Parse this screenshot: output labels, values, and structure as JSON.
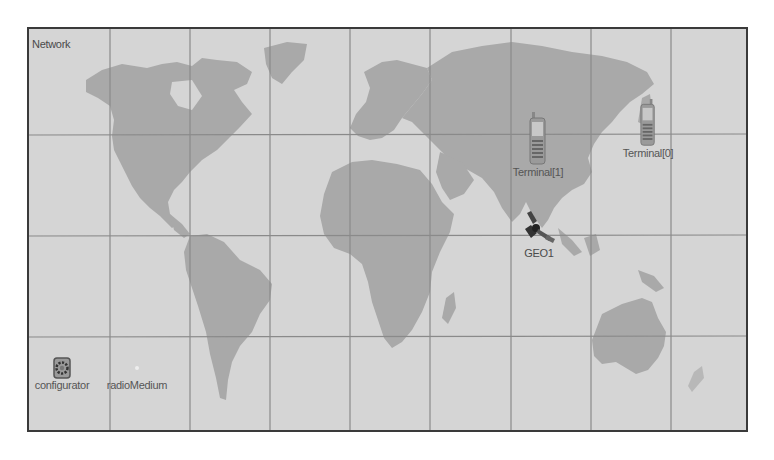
{
  "network": {
    "title": "Network"
  },
  "nodes": {
    "terminal0": {
      "label": "Terminal[0]",
      "icon": "cellphone-icon"
    },
    "terminal1": {
      "label": "Terminal[1]",
      "icon": "cellphone-icon"
    },
    "geo1": {
      "label": "GEO1",
      "icon": "satellite-icon"
    },
    "configurator": {
      "label": "configurator",
      "icon": "gear-icon"
    },
    "radioMedium": {
      "label": "radioMedium",
      "icon": "radio-medium-icon"
    }
  },
  "colors": {
    "ocean": "#d5d5d5",
    "land": "#a9a9a9",
    "grid": "#8a8a8a",
    "border": "#3a3a3a"
  }
}
